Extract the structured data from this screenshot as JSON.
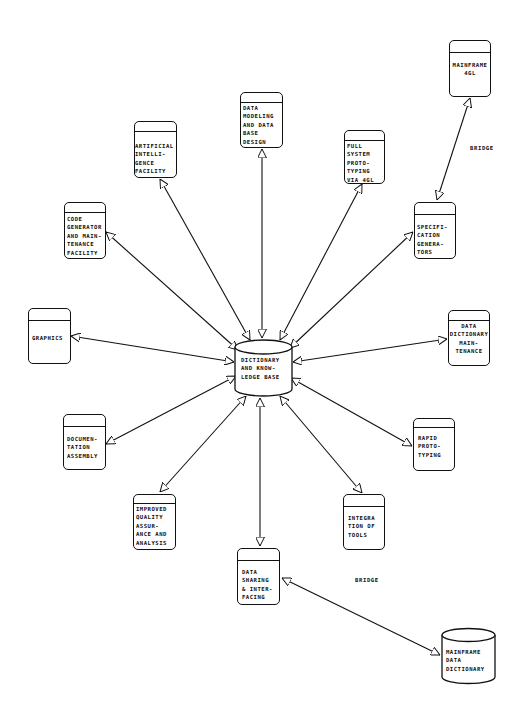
{
  "diagram": {
    "type": "hub-and-spoke",
    "hub": {
      "id": "dictionary",
      "shape": "cylinder",
      "label_lines": [
        "DICTIONARY",
        "AND KNOW-",
        "LEDGE BASE"
      ]
    },
    "nodes": [
      {
        "id": "data-modeling",
        "shape": "box",
        "label_lines": [
          "DATA",
          "MODELING",
          "AND DATA",
          "BASE",
          "DESIGN"
        ]
      },
      {
        "id": "artificial-intelligence",
        "shape": "box",
        "label_lines": [
          "ARTIFICIAL",
          "INTELLI-",
          "GENCE",
          "FACILITY"
        ]
      },
      {
        "id": "full-system-prototyping",
        "shape": "box",
        "label_lines": [
          "FULL",
          "SYSTEM",
          "PROTO-",
          "TYPING",
          "VIA 4GL"
        ]
      },
      {
        "id": "mainframe-4gl",
        "shape": "box",
        "label_lines": [
          "MAINFRAME",
          "4GL"
        ]
      },
      {
        "id": "specification-generators",
        "shape": "box",
        "label_lines": [
          "SPECIFI-",
          "CATION",
          "GENERA-",
          "TORS"
        ]
      },
      {
        "id": "code-generator",
        "shape": "box",
        "label_lines": [
          "CODE",
          "GENERATOR",
          "AND MAIN-",
          "TENANCE",
          "FACILITY"
        ]
      },
      {
        "id": "graphics",
        "shape": "box",
        "label_lines": [
          "GRAPHICS"
        ]
      },
      {
        "id": "data-dictionary-maintenance",
        "shape": "box",
        "label_lines": [
          "DATA",
          "DICTIONARY",
          "MAIN-",
          "TENANCE"
        ]
      },
      {
        "id": "documentation-assembly",
        "shape": "box",
        "label_lines": [
          "DOCUMEN-",
          "TATION",
          "ASSEMBLY"
        ]
      },
      {
        "id": "rapid-prototyping",
        "shape": "box",
        "label_lines": [
          "RAPID",
          "PROTO-",
          "TYPING"
        ]
      },
      {
        "id": "improved-quality",
        "shape": "box",
        "label_lines": [
          "IMPROVED",
          "QUALITY",
          "ASSUR-",
          "ANCE AND",
          "ANALYSIS"
        ]
      },
      {
        "id": "integration-of-tools",
        "shape": "box",
        "label_lines": [
          "INTEGRA",
          "TION OF",
          "TOOLS"
        ]
      },
      {
        "id": "data-sharing",
        "shape": "box",
        "label_lines": [
          "DATA",
          "SHARING",
          "& INTER-",
          "FACING"
        ]
      },
      {
        "id": "mainframe-data-dictionary",
        "shape": "cylinder",
        "label_lines": [
          "MAINFRAME",
          "DATA",
          "DICTIONARY"
        ]
      }
    ],
    "edges": [
      {
        "from": "dictionary",
        "to": "data-modeling",
        "arrows": "both"
      },
      {
        "from": "dictionary",
        "to": "artificial-intelligence",
        "arrows": "both"
      },
      {
        "from": "dictionary",
        "to": "full-system-prototyping",
        "arrows": "both"
      },
      {
        "from": "dictionary",
        "to": "specification-generators",
        "arrows": "both"
      },
      {
        "from": "dictionary",
        "to": "code-generator",
        "arrows": "both"
      },
      {
        "from": "dictionary",
        "to": "graphics",
        "arrows": "both"
      },
      {
        "from": "dictionary",
        "to": "data-dictionary-maintenance",
        "arrows": "both"
      },
      {
        "from": "dictionary",
        "to": "documentation-assembly",
        "arrows": "both"
      },
      {
        "from": "dictionary",
        "to": "rapid-prototyping",
        "arrows": "both"
      },
      {
        "from": "dictionary",
        "to": "improved-quality",
        "arrows": "both"
      },
      {
        "from": "dictionary",
        "to": "integration-of-tools",
        "arrows": "both"
      },
      {
        "from": "dictionary",
        "to": "data-sharing",
        "arrows": "both"
      },
      {
        "from": "specification-generators",
        "to": "mainframe-4gl",
        "arrows": "both",
        "label": "BRIDGE"
      },
      {
        "from": "data-sharing",
        "to": "mainframe-data-dictionary",
        "arrows": "both",
        "label": "BRIDGE"
      }
    ],
    "annotations": {
      "bridge_top": "BRIDGE",
      "bridge_bottom": "BRIDGE"
    }
  },
  "labels": {
    "hub": "DICTIONARY\nAND KNOW-\nLEDGE BASE",
    "data_modeling": "DATA\nMODELING\nAND DATA\nBASE\nDESIGN",
    "ai": "ARTIFICIAL\nINTELLI-\nGENCE\nFACILITY",
    "full_system": "FULL\nSYSTEM\nPROTO-\nTYPING\nVIA 4GL",
    "mainframe_4gl": "MAINFRAME\n4GL",
    "specification": "SPECIFI-\nCATION\nGENERA-\nTORS",
    "code_generator": "CODE\nGENERATOR\nAND MAIN-\nTENANCE\nFACILITY",
    "graphics": "GRAPHICS",
    "dd_maintenance": "DATA\nDICTIONARY\nMAIN-\nTENANCE",
    "documentation": "DOCUMEN-\nTATION\nASSEMBLY",
    "rapid_prototyping": "RAPID\nPROTO-\nTYPING",
    "improved_quality": "IMPROVED\nQUALITY\nASSUR-\nANCE AND\nANALYSIS",
    "integration": "INTEGRA\nTION OF\nTOOLS",
    "data_sharing": "DATA\nSHARING\n& INTER-\nFACING",
    "mainframe_dd": "MAINFRAME\nDATA\nDICTIONARY",
    "bridge_top": "BRIDGE",
    "bridge_bottom": "BRIDGE"
  }
}
